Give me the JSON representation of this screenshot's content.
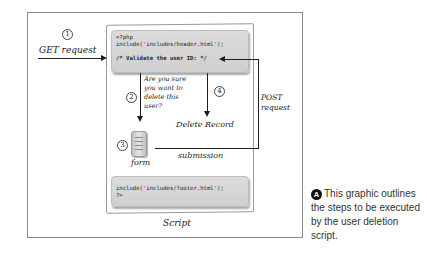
{
  "diagram": {
    "title_label": "Script",
    "steps": [
      {
        "number": "1",
        "label": "GET request"
      },
      {
        "number": "2",
        "label": "Are you sure you want to delete this user?"
      },
      {
        "number": "3",
        "label": "form"
      },
      {
        "number": "4",
        "label": "Delete Record"
      }
    ],
    "step2_lines": [
      "Are you sure",
      "you want to",
      "delete this",
      "user?"
    ],
    "post_label_lines": [
      "POST",
      "request"
    ],
    "submission_label": "submission",
    "code_top": {
      "line1": "<?php",
      "line2": "include('includes/header.html');",
      "line3": "/* Validate the user ID: */"
    },
    "code_bottom": {
      "line1": "include('includes/footer.html');",
      "line2": "?>"
    }
  },
  "caption": {
    "badge": "A",
    "text": "This graphic outlines the steps to be executed by the user deletion script."
  }
}
